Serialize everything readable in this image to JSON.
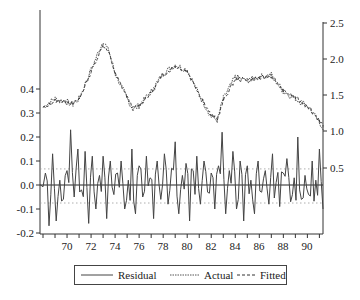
{
  "chart_data": {
    "type": "line",
    "title": "",
    "xlabel": "",
    "ylabel_left": "",
    "ylabel_right": "",
    "x_range": [
      67.75,
      91.3
    ],
    "x_ticks": [
      "70",
      "72",
      "74",
      "76",
      "78",
      "80",
      "82",
      "84",
      "86",
      "88",
      "90"
    ],
    "left_axis": {
      "ticks": [
        "0.4",
        "0.3",
        "0.2",
        "0.1",
        "0.0",
        "-0.1",
        "-0.2"
      ],
      "range": [
        -0.2,
        0.4
      ],
      "series": "Residual"
    },
    "right_axis": {
      "ticks": [
        "2.5",
        "2.0",
        "1.5",
        "1.0",
        "0.5"
      ],
      "range": [
        0.0,
        2.5
      ],
      "series": [
        "Actual",
        "Fitted"
      ]
    },
    "residual_std_bands": [
      0.067,
      -0.075
    ],
    "series": [
      {
        "name": "Actual",
        "axis": "right",
        "x": [
          68,
          69,
          70,
          70.5,
          71,
          72,
          73,
          73.5,
          74,
          75,
          75.5,
          76,
          77,
          78,
          79,
          80,
          81,
          82,
          82.5,
          83,
          84,
          85,
          86,
          87,
          88,
          89,
          90,
          91,
          91.3
        ],
        "values": [
          1.33,
          1.45,
          1.4,
          1.37,
          1.45,
          1.85,
          2.25,
          2.1,
          1.8,
          1.45,
          1.3,
          1.35,
          1.55,
          1.8,
          1.92,
          1.85,
          1.5,
          1.2,
          1.15,
          1.45,
          1.75,
          1.7,
          1.75,
          1.78,
          1.55,
          1.45,
          1.35,
          1.12,
          1.05
        ]
      },
      {
        "name": "Fitted",
        "axis": "right",
        "x": [
          68,
          69,
          70,
          70.5,
          71,
          72,
          73,
          73.5,
          74,
          75,
          75.5,
          76,
          77,
          78,
          79,
          80,
          81,
          82,
          82.5,
          83,
          84,
          85,
          86,
          87,
          88,
          89,
          90,
          91,
          91.3
        ],
        "values": [
          1.32,
          1.42,
          1.41,
          1.38,
          1.44,
          1.82,
          2.2,
          2.08,
          1.8,
          1.47,
          1.32,
          1.36,
          1.53,
          1.78,
          1.9,
          1.83,
          1.52,
          1.22,
          1.16,
          1.42,
          1.72,
          1.71,
          1.74,
          1.76,
          1.56,
          1.46,
          1.36,
          1.14,
          1.06
        ]
      },
      {
        "name": "Residual",
        "axis": "left",
        "values_note": "high-frequency noise oscillating around 0 within roughly -0.17 to 0.23",
        "x": [
          67.8,
          68.2,
          68.5,
          68.8,
          69.1,
          69.4,
          69.7,
          70.0,
          70.3,
          70.6,
          70.9,
          71.2,
          71.5,
          71.8,
          72.1,
          72.4,
          72.7,
          73.0,
          73.3,
          73.6,
          73.9,
          74.2,
          74.5,
          74.8,
          75.1,
          75.4,
          75.7,
          76.0,
          76.3,
          76.6,
          76.9,
          77.2,
          77.5,
          77.8,
          78.1,
          78.4,
          78.7,
          79.0,
          79.3,
          79.6,
          79.9,
          80.2,
          80.5,
          80.8,
          81.1,
          81.4,
          81.7,
          82.0,
          82.3,
          82.6,
          82.9,
          83.2,
          83.5,
          83.8,
          84.1,
          84.4,
          84.7,
          85.0,
          85.3,
          85.6,
          85.9,
          86.2,
          86.5,
          86.8,
          87.1,
          87.4,
          87.7,
          88.0,
          88.3,
          88.6,
          88.9,
          89.2,
          89.5,
          89.8,
          90.1,
          90.4,
          90.7,
          91.0,
          91.3
        ],
        "values": [
          0.0,
          0.05,
          -0.17,
          0.13,
          -0.15,
          0.02,
          -0.06,
          0.06,
          0.23,
          -0.05,
          0.15,
          -0.02,
          0.14,
          -0.16,
          0.12,
          -0.1,
          0.04,
          0.12,
          -0.14,
          0.1,
          -0.04,
          0.05,
          0.1,
          -0.1,
          0.02,
          0.15,
          -0.12,
          0.08,
          -0.05,
          0.12,
          0.03,
          -0.14,
          0.1,
          -0.06,
          0.13,
          -0.08,
          0.07,
          0.18,
          -0.12,
          0.04,
          0.09,
          -0.15,
          0.06,
          0.12,
          -0.08,
          0.1,
          -0.03,
          0.05,
          -0.1,
          0.08,
          0.22,
          -0.12,
          0.06,
          0.14,
          -0.1,
          0.1,
          -0.15,
          0.08,
          0.02,
          -0.12,
          0.1,
          -0.03,
          0.06,
          -0.08,
          0.13,
          0.01,
          -0.09,
          0.05,
          0.11,
          -0.07,
          0.03,
          0.2,
          -0.06,
          0.04,
          -0.04,
          0.1,
          0.02,
          0.15,
          -0.1
        ]
      }
    ],
    "legend": {
      "position": "bottom",
      "entries": [
        "Residual",
        "Actual",
        "Fitted"
      ]
    },
    "grid": false
  },
  "legend": {
    "residual": "Residual",
    "actual": "Actual",
    "fitted": "Fitted"
  },
  "axes": {
    "left_ticks": [
      "0.4",
      "0.3",
      "0.2",
      "0.1",
      "0.0",
      "-0.2",
      "-0.1"
    ],
    "right_ticks": [
      "2.5",
      "2.0",
      "1.5",
      "1.0",
      "0.5"
    ],
    "x_ticks": [
      "70",
      "72",
      "74",
      "76",
      "78",
      "80",
      "82",
      "84",
      "86",
      "88",
      "90"
    ]
  }
}
